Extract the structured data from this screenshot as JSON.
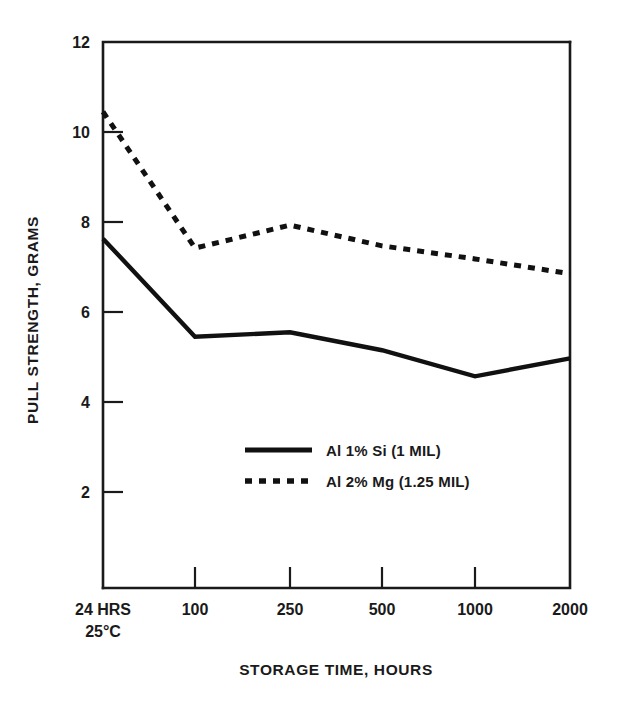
{
  "chart_data": {
    "type": "line",
    "title": "",
    "xlabel": "STORAGE TIME, HOURS",
    "ylabel": "PULL STRENGTH, GRAMS",
    "categories": [
      "24 HRS 25°C",
      "100",
      "250",
      "500",
      "1000",
      "2000"
    ],
    "x_tick_labels": [
      "24 HRS",
      "100",
      "250",
      "500",
      "1000",
      "2000"
    ],
    "x_tick_sublabel": "25°C",
    "y_tick_labels": [
      "12",
      "10",
      "8",
      "6",
      "4",
      "2"
    ],
    "y_tick_values": [
      12,
      10,
      8,
      6,
      4,
      2
    ],
    "ylim": [
      0.16,
      12.15
    ],
    "grid": false,
    "legend_position": "center",
    "series": [
      {
        "name": "Al 1% Si (1 MIL)",
        "style": "solid",
        "color": "#111111",
        "values": [
          7.63,
          5.45,
          5.55,
          5.15,
          4.57,
          4.97
        ]
      },
      {
        "name": "Al 2% Mg (1.25 MIL)",
        "style": "dotted",
        "color": "#111111",
        "values": [
          10.45,
          7.42,
          7.93,
          7.47,
          7.18,
          6.85
        ]
      }
    ]
  },
  "axes": {
    "y_title": "PULL STRENGTH, GRAMS",
    "x_title": "STORAGE TIME, HOURS",
    "y_tick_0": "12",
    "y_tick_1": "10",
    "y_tick_2": "8",
    "y_tick_3": "6",
    "y_tick_4": "4",
    "y_tick_5": "2",
    "x_tick_0_line1": "24 HRS",
    "x_tick_0_line2": "25°C",
    "x_tick_1": "100",
    "x_tick_2": "250",
    "x_tick_3": "500",
    "x_tick_4": "1000",
    "x_tick_5": "2000"
  },
  "legend": {
    "entry_0_label": "Al 1% Si (1 MIL)",
    "entry_1_label": "Al 2% Mg (1.25 MIL)"
  },
  "colors": {
    "line": "#111111",
    "axis": "#1a1a1a",
    "background": "#ffffff"
  }
}
